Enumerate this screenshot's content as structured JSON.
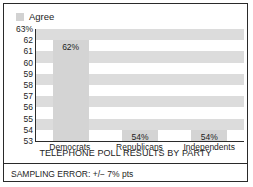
{
  "legend": {
    "swatch_name": "agree-swatch",
    "label": "Agree",
    "color": "#d2d2d2"
  },
  "footer": {
    "sampling_error": "SAMPLING ERROR: +/− 7% pts"
  },
  "chart_data": {
    "type": "bar",
    "title": "TELEPHONE POLL RESULTS BY PARTY",
    "xlabel": "",
    "ylabel": "",
    "categories": [
      "Democrats",
      "Republicans",
      "Independents"
    ],
    "values": [
      62,
      54,
      54
    ],
    "value_labels": [
      "62%",
      "54%",
      "54%"
    ],
    "series": [
      {
        "name": "Agree",
        "values": [
          62,
          54,
          54
        ]
      }
    ],
    "ylim": [
      53,
      63
    ],
    "ytick_labels": [
      "63%",
      "62",
      "61",
      "60",
      "59",
      "58",
      "57",
      "56",
      "55",
      "54",
      "53"
    ],
    "ytick_values": [
      63,
      62,
      61,
      60,
      59,
      58,
      57,
      56,
      55,
      54,
      53
    ],
    "grid": false,
    "banded_background": true,
    "legend_position": "top-left",
    "bar_color": "#d4d4d4"
  }
}
